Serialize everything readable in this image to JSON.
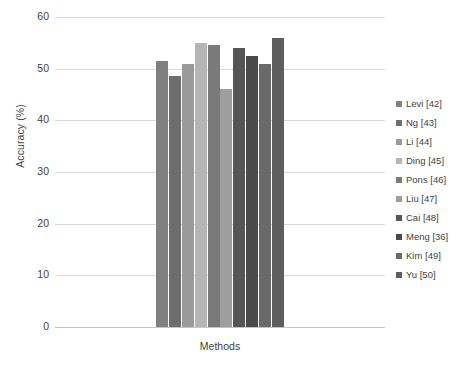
{
  "chart_data": {
    "type": "bar",
    "title": "",
    "xlabel": "Methods",
    "ylabel": "Accuracy (%)",
    "ylim": [
      0,
      60
    ],
    "ytick_labels": [
      "60",
      "50",
      "40",
      "30",
      "20",
      "10",
      "0"
    ],
    "yticks": [
      60,
      50,
      40,
      30,
      20,
      10,
      0
    ],
    "grid": true,
    "legend_position": "right",
    "categories": [
      "Levi [42]",
      "Ng [43]",
      "Li [44]",
      "Ding [45]",
      "Pons [46]",
      "Liu [47]",
      "Cai [48]",
      "Meng [36]",
      "Kim [49]",
      "Yu [50]"
    ],
    "values": [
      51.5,
      48.5,
      51.0,
      55.0,
      54.5,
      46.0,
      54.0,
      52.5,
      51.0,
      56.0
    ],
    "colors": [
      "#808080",
      "#6e6e6e",
      "#9a9a9a",
      "#b5b5b5",
      "#7a7a7a",
      "#9e9e9e",
      "#555555",
      "#4a4a4a",
      "#6a6a6a",
      "#5e5e5e"
    ]
  },
  "legend": {
    "items": [
      {
        "label": "Levi [42]",
        "color": "#808080"
      },
      {
        "label": "Ng [43]",
        "color": "#6e6e6e"
      },
      {
        "label": "Li [44]",
        "color": "#9a9a9a"
      },
      {
        "label": "Ding [45]",
        "color": "#b5b5b5"
      },
      {
        "label": "Pons [46]",
        "color": "#7a7a7a"
      },
      {
        "label": "Liu [47]",
        "color": "#9e9e9e"
      },
      {
        "label": "Cai [48]",
        "color": "#555555"
      },
      {
        "label": "Meng [36]",
        "color": "#4a4a4a"
      },
      {
        "label": "Kim [49]",
        "color": "#6a6a6a"
      },
      {
        "label": "Yu [50]",
        "color": "#5e5e5e"
      }
    ]
  },
  "axes": {
    "y_title": "Accuracy (%)",
    "x_title": "Methods"
  }
}
